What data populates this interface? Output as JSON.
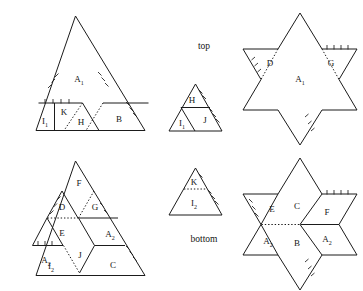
{
  "figure": {
    "title": "",
    "captions": {
      "top": "top",
      "bottom": "bottom"
    },
    "panels": [
      {
        "id": "top-left-triangle",
        "name": "large-triangle-top",
        "shape": "triangle",
        "pieces": [
          "A1",
          "I1",
          "K",
          "H",
          "B"
        ]
      },
      {
        "id": "top-middle-triangle",
        "name": "small-triangle-top",
        "shape": "triangle",
        "pieces": [
          "H",
          "I1",
          "J"
        ]
      },
      {
        "id": "top-right-star",
        "name": "star-top",
        "shape": "hexagram",
        "pieces": [
          "D",
          "G",
          "A1"
        ]
      },
      {
        "id": "bottom-left-triangle",
        "name": "large-triangle-bottom",
        "shape": "triangle",
        "pieces": [
          "F",
          "D",
          "G",
          "E",
          "A2",
          "J",
          "A2",
          "I2",
          "C"
        ]
      },
      {
        "id": "bottom-middle-triangle",
        "name": "small-triangle-bottom",
        "shape": "triangle",
        "pieces": [
          "K",
          "I2"
        ]
      },
      {
        "id": "bottom-right-star",
        "name": "star-bottom",
        "shape": "hexagram",
        "pieces": [
          "E",
          "C",
          "F",
          "A2",
          "B",
          "A2"
        ]
      }
    ],
    "labels": {
      "A1_topleft": "A",
      "A1_topleft_sub": "1",
      "I1_topleft": "I",
      "I1_topleft_sub": "1",
      "K_topleft": "K",
      "H_topleft": "H",
      "B_topleft": "B",
      "H_topmid": "H",
      "I1_topmid": "I",
      "I1_topmid_sub": "1",
      "J_topmid": "J",
      "D_topright": "D",
      "G_topright": "G",
      "A1_topright": "A",
      "A1_topright_sub": "1",
      "F_botleft": "F",
      "D_botleft": "D",
      "G_botleft": "G",
      "E_botleft": "E",
      "A2a_botleft": "A",
      "A2a_botleft_sub": "2",
      "J_botleft": "J",
      "A2b_botleft": "A",
      "A2b_botleft_sub": "2",
      "I2_botleft": "I",
      "I2_botleft_sub": "2",
      "C_botleft": "C",
      "K_botmid": "K",
      "I2_botmid": "I",
      "I2_botmid_sub": "2",
      "E_botright": "E",
      "C_botright": "C",
      "F_botright": "F",
      "A2a_botright": "A",
      "A2a_botright_sub": "2",
      "B_botright": "B",
      "A2b_botright": "A",
      "A2b_botright_sub": "2"
    },
    "colors": {
      "stroke": "#1b1b1b",
      "text": "#151515",
      "background": "#ffffff"
    }
  }
}
